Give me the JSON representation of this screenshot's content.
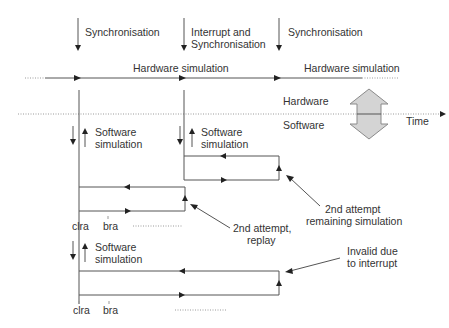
{
  "diagram": {
    "top_labels": {
      "sync_1": "Synchronisation",
      "interrupt_line1": "Interrupt and",
      "interrupt_line2": "Synchronisation",
      "sync_2": "Synchronisation"
    },
    "hardware_timeline": {
      "label_1": "Hardware simulation",
      "label_2": "Hardware simulation"
    },
    "domain_divider": {
      "hardware_label": "Hardware",
      "software_label": "Software",
      "time_label": "Time"
    },
    "software_blocks": [
      {
        "line1": "Software",
        "line2": "simulation"
      },
      {
        "line1": "Software",
        "line2": "simulation"
      },
      {
        "line1": "Software",
        "line2": "simulation"
      }
    ],
    "instructions": {
      "clra_1": "clra",
      "bra_1": "bra",
      "clra_2": "clra",
      "bra_2": "bra"
    },
    "annotations": {
      "replay_line1": "2nd attempt,",
      "replay_line2": "replay",
      "remaining_line1": "2nd attempt",
      "remaining_line2": "remaining simulation",
      "invalid_line1": "Invalid due",
      "invalid_line2": "to interrupt"
    },
    "colors": {
      "line": "#555555",
      "big_arrow_fill": "#d4d4d4",
      "big_arrow_stroke": "#8a8a8a",
      "text": "#333333"
    }
  }
}
